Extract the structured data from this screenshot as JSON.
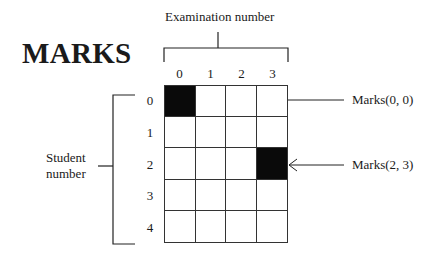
{
  "title": "MARKS",
  "top_label": "Examination number",
  "side_label_line1": "Student",
  "side_label_line2": "number",
  "columns": [
    "0",
    "1",
    "2",
    "3"
  ],
  "rows": [
    "0",
    "1",
    "2",
    "3",
    "4"
  ],
  "filled_cells": [
    [
      0,
      0
    ],
    [
      2,
      3
    ]
  ],
  "callouts": [
    {
      "label": "Marks(0, 0)",
      "row": 0,
      "col": 0
    },
    {
      "label": "Marks(2, 3)",
      "row": 2,
      "col": 3
    }
  ]
}
